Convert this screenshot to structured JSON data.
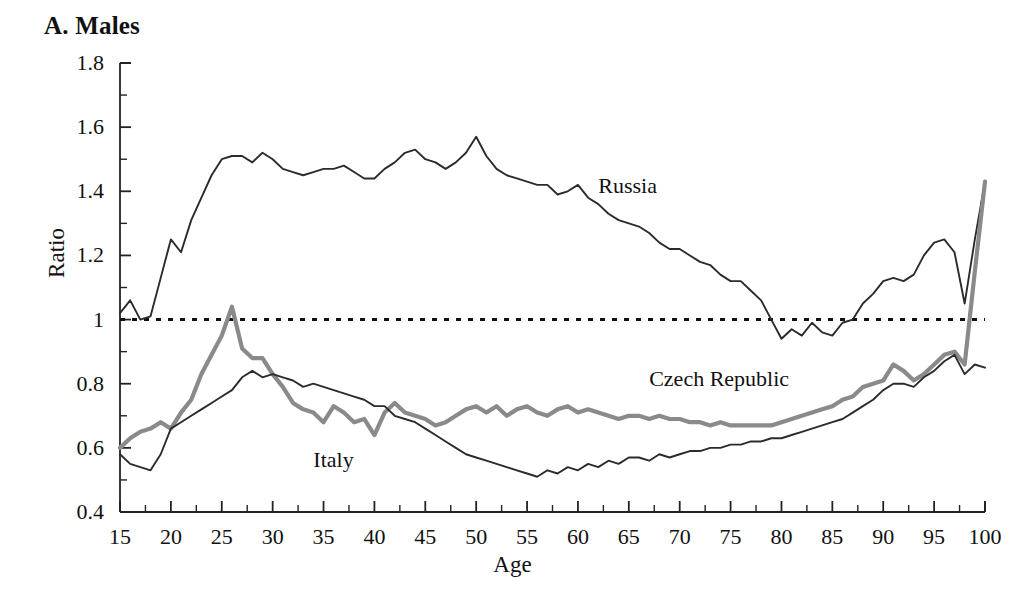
{
  "figure": {
    "panel_title": "A. Males",
    "background": "#ffffff"
  },
  "chart_data": {
    "type": "line",
    "title": "A. Males",
    "xlabel": "Age",
    "ylabel": "Ratio",
    "xlim": [
      15,
      100
    ],
    "ylim": [
      0.4,
      1.8
    ],
    "grid": false,
    "legend": "inline-annotations",
    "xticks": [
      15,
      20,
      25,
      30,
      35,
      40,
      45,
      50,
      55,
      60,
      65,
      70,
      75,
      80,
      85,
      90,
      95,
      100
    ],
    "xtick_labels": [
      "15",
      "20",
      "25",
      "30",
      "35",
      "40",
      "45",
      "50",
      "55",
      "60",
      "65",
      "70",
      "75",
      "80",
      "85",
      "90",
      "95",
      "100"
    ],
    "xminor_step": 2.5,
    "yticks": [
      0.4,
      0.6,
      0.8,
      1.0,
      1.2,
      1.4,
      1.6,
      1.8
    ],
    "ytick_labels": [
      "0.4",
      "0.6",
      "0.8",
      "1",
      "1.2",
      "1.4",
      "1.6",
      "1.8"
    ],
    "yminor_step": 0.1,
    "reference_line": {
      "name": "unity-reference-line",
      "y": 1.0,
      "style": "dotted",
      "color": "#111111"
    },
    "x": [
      15,
      16,
      17,
      18,
      19,
      20,
      21,
      22,
      23,
      24,
      25,
      26,
      27,
      28,
      29,
      30,
      31,
      32,
      33,
      34,
      35,
      36,
      37,
      38,
      39,
      40,
      41,
      42,
      43,
      44,
      45,
      46,
      47,
      48,
      49,
      50,
      51,
      52,
      53,
      54,
      55,
      56,
      57,
      58,
      59,
      60,
      61,
      62,
      63,
      64,
      65,
      66,
      67,
      68,
      69,
      70,
      71,
      72,
      73,
      74,
      75,
      76,
      77,
      78,
      79,
      80,
      81,
      82,
      83,
      84,
      85,
      86,
      87,
      88,
      89,
      90,
      91,
      92,
      93,
      94,
      95,
      96,
      97,
      98,
      99,
      100
    ],
    "series": [
      {
        "name": "Russia",
        "color": "#2b2b2b",
        "width": 1.9,
        "label_x": 62,
        "label_y": 1.41,
        "values": [
          1.02,
          1.06,
          1.0,
          1.01,
          1.13,
          1.25,
          1.21,
          1.31,
          1.38,
          1.45,
          1.5,
          1.51,
          1.51,
          1.49,
          1.52,
          1.5,
          1.47,
          1.46,
          1.45,
          1.46,
          1.47,
          1.47,
          1.48,
          1.46,
          1.44,
          1.44,
          1.47,
          1.49,
          1.52,
          1.53,
          1.5,
          1.49,
          1.47,
          1.49,
          1.52,
          1.57,
          1.51,
          1.47,
          1.45,
          1.44,
          1.43,
          1.42,
          1.42,
          1.39,
          1.4,
          1.42,
          1.38,
          1.36,
          1.33,
          1.31,
          1.3,
          1.29,
          1.27,
          1.24,
          1.22,
          1.22,
          1.2,
          1.18,
          1.17,
          1.14,
          1.12,
          1.12,
          1.09,
          1.06,
          1.0,
          0.94,
          0.97,
          0.95,
          0.99,
          0.96,
          0.95,
          0.99,
          1.0,
          1.05,
          1.08,
          1.12,
          1.13,
          1.12,
          1.14,
          1.2,
          1.24,
          1.25,
          1.21,
          1.05,
          1.25,
          1.43
        ]
      },
      {
        "name": "Czech Republic",
        "color": "#8a8a8a",
        "width": 4.2,
        "label_x": 67,
        "label_y": 0.81,
        "values": [
          0.6,
          0.63,
          0.65,
          0.66,
          0.68,
          0.66,
          0.71,
          0.75,
          0.83,
          0.89,
          0.95,
          1.04,
          0.91,
          0.88,
          0.88,
          0.83,
          0.79,
          0.74,
          0.72,
          0.71,
          0.68,
          0.73,
          0.71,
          0.68,
          0.69,
          0.64,
          0.71,
          0.74,
          0.71,
          0.7,
          0.69,
          0.67,
          0.68,
          0.7,
          0.72,
          0.73,
          0.71,
          0.73,
          0.7,
          0.72,
          0.73,
          0.71,
          0.7,
          0.72,
          0.73,
          0.71,
          0.72,
          0.71,
          0.7,
          0.69,
          0.7,
          0.7,
          0.69,
          0.7,
          0.69,
          0.69,
          0.68,
          0.68,
          0.67,
          0.68,
          0.67,
          0.67,
          0.67,
          0.67,
          0.67,
          0.68,
          0.69,
          0.7,
          0.71,
          0.72,
          0.73,
          0.75,
          0.76,
          0.79,
          0.8,
          0.81,
          0.86,
          0.84,
          0.81,
          0.83,
          0.86,
          0.89,
          0.9,
          0.86,
          1.15,
          1.43
        ]
      },
      {
        "name": "Italy",
        "color": "#2b2b2b",
        "width": 1.9,
        "label_x": 34,
        "label_y": 0.555,
        "values": [
          0.58,
          0.55,
          0.54,
          0.53,
          0.58,
          0.66,
          0.68,
          0.7,
          0.72,
          0.74,
          0.76,
          0.78,
          0.82,
          0.84,
          0.82,
          0.83,
          0.82,
          0.81,
          0.79,
          0.8,
          0.79,
          0.78,
          0.77,
          0.76,
          0.75,
          0.73,
          0.73,
          0.7,
          0.69,
          0.68,
          0.66,
          0.64,
          0.62,
          0.6,
          0.58,
          0.57,
          0.56,
          0.55,
          0.54,
          0.53,
          0.52,
          0.51,
          0.53,
          0.52,
          0.54,
          0.53,
          0.55,
          0.54,
          0.56,
          0.55,
          0.57,
          0.57,
          0.56,
          0.58,
          0.57,
          0.58,
          0.59,
          0.59,
          0.6,
          0.6,
          0.61,
          0.61,
          0.62,
          0.62,
          0.63,
          0.63,
          0.64,
          0.65,
          0.66,
          0.67,
          0.68,
          0.69,
          0.71,
          0.73,
          0.75,
          0.78,
          0.8,
          0.8,
          0.79,
          0.82,
          0.84,
          0.87,
          0.89,
          0.83,
          0.86,
          0.85
        ]
      }
    ]
  }
}
